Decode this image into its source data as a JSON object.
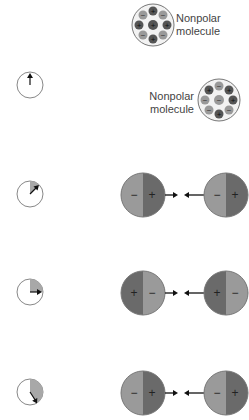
{
  "colors": {
    "background": "#ffffff",
    "outline": "#777777",
    "dark_half": "#6a6a6a",
    "light_half": "#9a9a9a",
    "clock_fill": "#a8a8a8",
    "arrow": "#111111",
    "text": "#444444"
  },
  "top_molecules": [
    {
      "label_line1": "Nonpolar",
      "label_line2": "molecule",
      "label_side": "right"
    },
    {
      "label_line1": "Nonpolar",
      "label_line2": "molecule",
      "label_side": "left"
    }
  ],
  "stages": [
    {
      "clock": {
        "hand_angle_deg": 0,
        "elapsed_label": "t0"
      },
      "pair": null
    },
    {
      "clock": {
        "hand_angle_deg": 45,
        "elapsed_label": "t1"
      },
      "pair": {
        "left": {
          "left_sign": "−",
          "right_sign": "+"
        },
        "right": {
          "left_sign": "−",
          "right_sign": "+"
        }
      }
    },
    {
      "clock": {
        "hand_angle_deg": 90,
        "elapsed_label": "t2"
      },
      "pair": {
        "left": {
          "left_sign": "+",
          "right_sign": "−"
        },
        "right": {
          "left_sign": "+",
          "right_sign": "−"
        }
      }
    },
    {
      "clock": {
        "hand_angle_deg": 150,
        "elapsed_label": "t3"
      },
      "pair": {
        "left": {
          "left_sign": "−",
          "right_sign": "+"
        },
        "right": {
          "left_sign": "−",
          "right_sign": "+"
        }
      }
    }
  ]
}
